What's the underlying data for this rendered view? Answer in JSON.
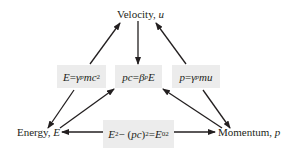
{
  "nodes": {
    "velocity": {
      "label": "Velocity, ",
      "var": "u"
    },
    "energy": {
      "label": "Energy, ",
      "var": "E"
    },
    "momentum": {
      "label": "Momentum, ",
      "var": "p"
    }
  },
  "equations": {
    "energy_eq": {
      "lhs": "E",
      "eq": " = ",
      "gamma": "γ",
      "gamma_sub": "p",
      "rest": "mc",
      "sup": "2"
    },
    "pc_eq": {
      "lhs": "pc",
      "eq": " = ",
      "beta": "β",
      "beta_sub": "p",
      "rest": "E"
    },
    "momentum_eq": {
      "lhs": "p",
      "eq": " = ",
      "gamma": "γ",
      "gamma_sub": "p",
      "rest": "mu"
    },
    "invariant_eq": {
      "t1": "E",
      "t1_sup": "2",
      "minus": " − (",
      "t2": "pc",
      "close": ")",
      "t2_sup": "2",
      "eq": " = ",
      "t3": "E",
      "t3_sub": "0",
      "t3_sup": "2"
    }
  },
  "colors": {
    "box_fill": "#ececec",
    "arrow": "#231f20",
    "text": "#231f20"
  }
}
